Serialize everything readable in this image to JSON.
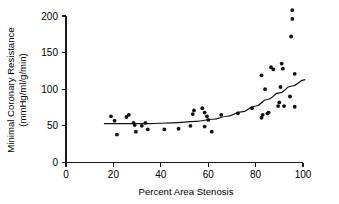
{
  "chart_data": {
    "type": "scatter",
    "title": "",
    "xlabel": "Percent Area Stenosis",
    "ylabel_line1": "Minimal Coronary Resistance",
    "ylabel_line2": "(mmHg/ml/g/min)",
    "xlim": [
      0,
      100
    ],
    "ylim": [
      0,
      200
    ],
    "xticks": [
      0,
      20,
      40,
      60,
      80,
      100
    ],
    "yticks": [
      0,
      50,
      100,
      150,
      200
    ],
    "xticklabels": [
      "0",
      "20",
      "40",
      "60",
      "80",
      "100"
    ],
    "yticklabels": [
      "0",
      "50",
      "100",
      "150",
      "200"
    ],
    "grid": false,
    "legend": false,
    "marker": "filled-circle",
    "marker_color": "#111111",
    "points": [
      {
        "x": 19.0,
        "y": 63
      },
      {
        "x": 20.5,
        "y": 57
      },
      {
        "x": 21.5,
        "y": 38
      },
      {
        "x": 25.5,
        "y": 62
      },
      {
        "x": 26.5,
        "y": 65
      },
      {
        "x": 28.5,
        "y": 54
      },
      {
        "x": 29.0,
        "y": 51
      },
      {
        "x": 29.5,
        "y": 42
      },
      {
        "x": 32.0,
        "y": 50
      },
      {
        "x": 33.5,
        "y": 54
      },
      {
        "x": 34.5,
        "y": 45
      },
      {
        "x": 41.5,
        "y": 45
      },
      {
        "x": 47.5,
        "y": 46
      },
      {
        "x": 52.5,
        "y": 50
      },
      {
        "x": 53.5,
        "y": 66
      },
      {
        "x": 54.0,
        "y": 71
      },
      {
        "x": 57.5,
        "y": 74
      },
      {
        "x": 58.5,
        "y": 68
      },
      {
        "x": 58.5,
        "y": 49
      },
      {
        "x": 59.5,
        "y": 63
      },
      {
        "x": 60.0,
        "y": 58
      },
      {
        "x": 61.5,
        "y": 42
      },
      {
        "x": 65.5,
        "y": 65
      },
      {
        "x": 72.5,
        "y": 67
      },
      {
        "x": 78.5,
        "y": 74
      },
      {
        "x": 82.5,
        "y": 119
      },
      {
        "x": 82.5,
        "y": 61
      },
      {
        "x": 83.0,
        "y": 65
      },
      {
        "x": 84.0,
        "y": 100
      },
      {
        "x": 85.0,
        "y": 67
      },
      {
        "x": 85.5,
        "y": 68
      },
      {
        "x": 86.5,
        "y": 130
      },
      {
        "x": 87.5,
        "y": 127
      },
      {
        "x": 89.5,
        "y": 77
      },
      {
        "x": 90.0,
        "y": 82
      },
      {
        "x": 90.5,
        "y": 103
      },
      {
        "x": 91.0,
        "y": 135
      },
      {
        "x": 91.5,
        "y": 128
      },
      {
        "x": 92.0,
        "y": 77
      },
      {
        "x": 94.5,
        "y": 90
      },
      {
        "x": 95.0,
        "y": 172
      },
      {
        "x": 95.5,
        "y": 208
      },
      {
        "x": 95.5,
        "y": 196
      },
      {
        "x": 96.5,
        "y": 121
      },
      {
        "x": 96.5,
        "y": 76
      }
    ],
    "fit_curve": {
      "description": "monotone increasing fitted trend line",
      "points": [
        {
          "x": 16.0,
          "y": 53
        },
        {
          "x": 25.0,
          "y": 53
        },
        {
          "x": 35.0,
          "y": 53
        },
        {
          "x": 45.0,
          "y": 54
        },
        {
          "x": 55.0,
          "y": 56
        },
        {
          "x": 62.0,
          "y": 59
        },
        {
          "x": 68.0,
          "y": 63
        },
        {
          "x": 74.0,
          "y": 69
        },
        {
          "x": 80.0,
          "y": 77
        },
        {
          "x": 85.0,
          "y": 86
        },
        {
          "x": 90.0,
          "y": 95
        },
        {
          "x": 95.0,
          "y": 104
        },
        {
          "x": 101.0,
          "y": 113
        }
      ]
    }
  }
}
